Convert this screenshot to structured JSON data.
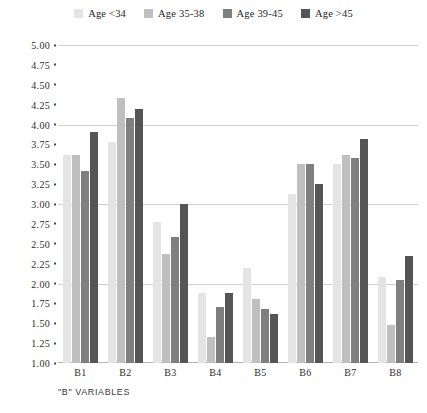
{
  "chart_data": {
    "type": "bar",
    "title": "",
    "subtitle": "",
    "xlabel": "\"B\" VARIABLES",
    "ylabel": "",
    "categories": [
      "B1",
      "B2",
      "B3",
      "B4",
      "B5",
      "B6",
      "B7",
      "B8"
    ],
    "series": [
      {
        "name": "Age <34",
        "color": "#e4e4e4",
        "values": [
          3.62,
          3.78,
          2.78,
          1.88,
          2.2,
          3.12,
          3.5,
          2.08
        ]
      },
      {
        "name": "Age 35-38",
        "color": "#bfbfbf",
        "values": [
          3.62,
          4.33,
          2.37,
          1.33,
          1.8,
          3.5,
          3.62,
          1.48
        ]
      },
      {
        "name": "Age 39-45",
        "color": "#7f7f7f",
        "values": [
          3.42,
          4.08,
          2.58,
          1.7,
          1.68,
          3.5,
          3.58,
          2.05
        ]
      },
      {
        "name": "Age >45",
        "color": "#555555",
        "values": [
          3.9,
          4.2,
          3.0,
          1.88,
          1.62,
          3.25,
          3.82,
          2.35
        ]
      }
    ],
    "ylim": [
      1.0,
      5.0
    ],
    "ytick_step": 0.25,
    "yticks": [
      "5.00",
      "4.75",
      "4.50",
      "4.25",
      "4.00",
      "3.75",
      "3.50",
      "3.25",
      "3.00",
      "2.75",
      "2.50",
      "2.25",
      "2.00",
      "1.75",
      "1.50",
      "1.25",
      "1.00"
    ],
    "gridlines_at": [
      5.0,
      4.0,
      3.0,
      2.0
    ],
    "grid": true,
    "legend_position": "top-center",
    "legend": [
      "Age <34",
      "Age 35-38",
      "Age 39-45",
      "Age >45"
    ]
  },
  "legend": {
    "items": [
      {
        "label": "Age <34",
        "color": "#e4e4e4"
      },
      {
        "label": "Age 35-38",
        "color": "#bfbfbf"
      },
      {
        "label": "Age 39-45",
        "color": "#7f7f7f"
      },
      {
        "label": "Age >45",
        "color": "#555555"
      }
    ]
  },
  "axis": {
    "x_title": "\"B\" VARIABLES"
  }
}
